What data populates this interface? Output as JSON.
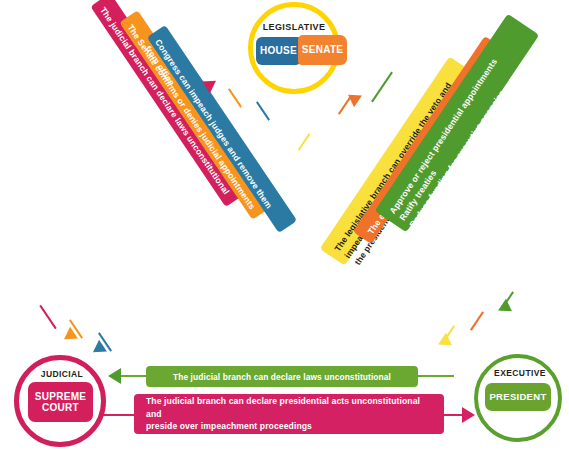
{
  "diagram": {
    "type": "triangle-flow"
  },
  "nodes": {
    "legislative": {
      "title": "LEGISLATIVE",
      "ring_color": "#ffd400",
      "chambers": [
        {
          "label": "HOUSE",
          "color": "#2a6e9e"
        },
        {
          "label": "SENATE",
          "color": "#f2822d"
        }
      ]
    },
    "judicial": {
      "title": "JUDICIAL",
      "ring_color": "#d01f5b",
      "body_line1": "SUPREME",
      "body_line2": "COURT",
      "body_color": "#d31f5c"
    },
    "executive": {
      "title": "EXECUTIVE",
      "ring_color": "#5aa02c",
      "body": "PRESIDENT",
      "body_color": "#6aa32e"
    }
  },
  "ribbons": {
    "judicial_to_legislative": {
      "text": "The judicial branch can declare laws unconstitutional",
      "color": "#d31f5c",
      "direction": "up"
    },
    "senate_confirms": {
      "text": "The Senate confirms or denies judicial appointments",
      "color": "#f7941e",
      "direction": "down"
    },
    "congress_impeach": {
      "text": "Congress can impeach judges and remove them from office",
      "color": "#2a7aa3",
      "direction": "down"
    },
    "legislative_override": {
      "line1": "The legislative branch can override the veto and impeach",
      "line2": "the president and remove them from office",
      "color": "#f9e03d",
      "direction": "down"
    },
    "executive_veto": {
      "text": "The executive branch can veto bills and implement laws",
      "color": "#f0712a",
      "direction": "up"
    },
    "senate_powers": {
      "line1": "Approve or reject presidential appointments",
      "line2": "Ratify treaties",
      "line3": "Reduce funding for executive agencies",
      "color": "#4f9b2e",
      "direction": "down"
    }
  },
  "bars": {
    "judicial_laws": {
      "text": "The judicial branch can declare laws unconstitutional",
      "color": "#6aa832",
      "direction": "left"
    },
    "judicial_presidential": {
      "line1": "The judicial branch can declare presidential acts unconstitutional and",
      "line2": "preside over impeachment proceedings",
      "color": "#d42163",
      "direction": "right"
    }
  }
}
